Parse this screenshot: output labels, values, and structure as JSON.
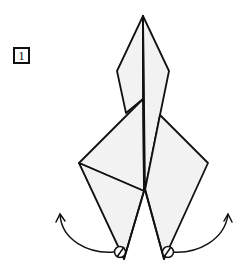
{
  "step": {
    "number": "1"
  },
  "colors": {
    "stroke": "#111111",
    "paper_fill": "#f2f2f2",
    "background": "#ffffff"
  },
  "diagram": {
    "annotations": [
      {
        "type": "curved-arrow",
        "side": "left",
        "meaning": "swing flap outward/up"
      },
      {
        "type": "curved-arrow",
        "side": "right",
        "meaning": "swing flap outward/up"
      },
      {
        "type": "pivot-circle",
        "side": "left"
      },
      {
        "type": "pivot-circle",
        "side": "right"
      }
    ]
  }
}
